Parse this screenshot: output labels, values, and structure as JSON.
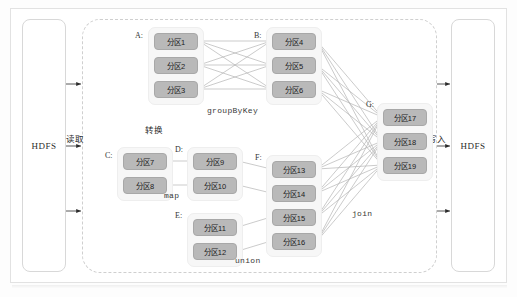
{
  "diagram": {
    "title_hidden": "",
    "storage": {
      "left": {
        "name": "HDFS",
        "arrow_label": "读取"
      },
      "right": {
        "name": "HDFS",
        "arrow_label": "写入"
      }
    },
    "cluster_label": "转换",
    "groups": [
      {
        "id": "A",
        "label": "A:",
        "x": 148,
        "y": 27,
        "w": 56,
        "h": 78,
        "partitions": [
          {
            "label": "分区1",
            "x": 154,
            "y": 33
          },
          {
            "label": "分区2",
            "x": 154,
            "y": 57
          },
          {
            "label": "分区3",
            "x": 154,
            "y": 81
          }
        ]
      },
      {
        "id": "B",
        "label": "B:",
        "x": 266,
        "y": 27,
        "w": 56,
        "h": 78,
        "partitions": [
          {
            "label": "分区4",
            "x": 272,
            "y": 33
          },
          {
            "label": "分区5",
            "x": 272,
            "y": 57
          },
          {
            "label": "分区6",
            "x": 272,
            "y": 81
          }
        ]
      },
      {
        "id": "C",
        "label": "C:",
        "x": 117,
        "y": 147,
        "w": 56,
        "h": 54,
        "partitions": [
          {
            "label": "分区7",
            "x": 123,
            "y": 153
          },
          {
            "label": "分区8",
            "x": 123,
            "y": 177
          }
        ]
      },
      {
        "id": "D",
        "label": "D:",
        "x": 187,
        "y": 147,
        "w": 56,
        "h": 54,
        "partitions": [
          {
            "label": "分区9",
            "x": 193,
            "y": 153
          },
          {
            "label": "分区10",
            "x": 193,
            "y": 177
          }
        ]
      },
      {
        "id": "E",
        "label": "E:",
        "x": 187,
        "y": 213,
        "w": 56,
        "h": 54,
        "partitions": [
          {
            "label": "分区11",
            "x": 193,
            "y": 219
          },
          {
            "label": "分区12",
            "x": 193,
            "y": 243
          }
        ]
      },
      {
        "id": "F",
        "label": "F:",
        "x": 266,
        "y": 155,
        "w": 56,
        "h": 102,
        "partitions": [
          {
            "label": "分区13",
            "x": 272,
            "y": 161
          },
          {
            "label": "分区14",
            "x": 272,
            "y": 185
          },
          {
            "label": "分区15",
            "x": 272,
            "y": 209
          },
          {
            "label": "分区16",
            "x": 272,
            "y": 233
          }
        ]
      },
      {
        "id": "G",
        "label": "G:",
        "x": 377,
        "y": 103,
        "w": 56,
        "h": 78,
        "partitions": [
          {
            "label": "分区17",
            "x": 383,
            "y": 109
          },
          {
            "label": "分区18",
            "x": 383,
            "y": 133
          },
          {
            "label": "分区19",
            "x": 383,
            "y": 157
          }
        ]
      }
    ],
    "operators": [
      {
        "name": "groupByKey",
        "x": 207,
        "y": 106
      },
      {
        "name": "map",
        "x": 164,
        "y": 191
      },
      {
        "name": "union",
        "x": 235,
        "y": 256
      },
      {
        "name": "join",
        "x": 352,
        "y": 209
      }
    ],
    "colors": {
      "partition_fill": "#b9b9b9",
      "group_fill": "#f7f7f7",
      "edge": "#b5b5b5",
      "dashed_border": "#cfcfcf",
      "frame_border": "#e2e2e2"
    }
  }
}
